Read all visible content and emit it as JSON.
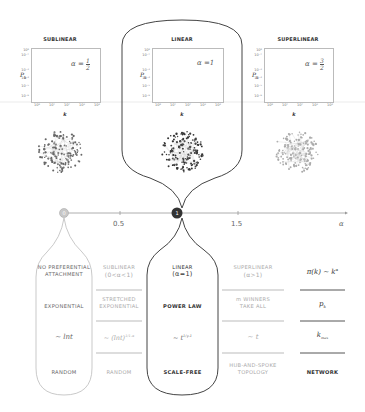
{
  "panels": [
    {
      "id": "sublinear",
      "title": "SUBLINEAR",
      "alpha_label": "α =",
      "alpha_num": "1",
      "alpha_den": "2",
      "ylabel": "P",
      "ylabel_sub": "k",
      "xlabel": "k",
      "style": "light"
    },
    {
      "id": "linear",
      "title": "LINEAR",
      "alpha_label": "α =1",
      "ylabel": "P",
      "ylabel_sub": "k",
      "xlabel": "k",
      "style": "highlight"
    },
    {
      "id": "superlinear",
      "title": "SUPERLINEAR",
      "alpha_label": "α =",
      "alpha_num": "3",
      "alpha_den": "2",
      "ylabel": "P",
      "ylabel_sub": "k",
      "xlabel": "k",
      "style": "light"
    }
  ],
  "plot_axes": {
    "yticks": [
      "10⁰",
      "10⁻¹",
      "10⁻³",
      "10⁻⁴",
      "10⁻⁵",
      "10⁻⁶"
    ],
    "xticks": [
      "10⁰",
      "10¹",
      "10²",
      "10³",
      "10⁴"
    ]
  },
  "axis": {
    "ticks": [
      {
        "label": "0",
        "marker": "circle-light"
      },
      {
        "label": "0.5",
        "marker": "tick"
      },
      {
        "label": "1",
        "marker": "circle-dark"
      },
      {
        "label": "1.5",
        "marker": "tick"
      }
    ],
    "variable": "α"
  },
  "table": {
    "columns": [
      {
        "id": "no_pa",
        "cells": [
          "NO PREFERENTIAL\nATTACHMENT",
          "EXPONENTIAL",
          "~ lnt",
          "RANDOM"
        ]
      },
      {
        "id": "sublinear",
        "cells": [
          "SUBLINEAR\n(0<α<1)",
          "STRETCHED\nEXPONENTIAL",
          "~ (lnt)^(1/(1-α))",
          "RANDOM"
        ]
      },
      {
        "id": "linear",
        "cells": [
          "LINEAR\n(α=1)",
          "POWER LAW",
          "~ t^(1/(γ-1))",
          "SCALE-FREE"
        ]
      },
      {
        "id": "superlinear",
        "cells": [
          "SUPERLINEAR\n(α>1)",
          "m WINNERS\nTAKE ALL",
          "~ t",
          "HUB-AND-SPOKE\nTOPOLOGY"
        ]
      },
      {
        "id": "legend",
        "cells": [
          "π(k) ~ k^α",
          "p_k",
          "k_max",
          "NETWORK"
        ]
      }
    ],
    "labels": {
      "no_pa_r1a": "NO PREFERENTIAL",
      "no_pa_r1b": "ATTACHMENT",
      "no_pa_r2": "EXPONENTIAL",
      "no_pa_r3": "~ lnt",
      "no_pa_r4": "RANDOM",
      "sub_r1a": "SUBLINEAR",
      "sub_r1b": "(0<α<1)",
      "sub_r2a": "STRETCHED",
      "sub_r2b": "EXPONENTIAL",
      "sub_r3": "~ (lnt)",
      "sub_r3_exp_num": "1",
      "sub_r3_exp_den": "1-α",
      "sub_r4": "RANDOM",
      "lin_r1a": "LINEAR",
      "lin_r1b": "(α=1)",
      "lin_r2": "POWER LAW",
      "lin_r3": "~ t",
      "lin_r3_exp_num": "1",
      "lin_r3_exp_den": "γ-1",
      "lin_r4": "SCALE-FREE",
      "sup_r1a": "SUPERLINEAR",
      "sup_r1b": "(α>1)",
      "sup_r2a": "m WINNERS",
      "sup_r2b": "TAKE ALL",
      "sup_r3": "~ t",
      "sup_r4a": "HUB-AND-SPOKE",
      "sup_r4b": "TOPOLOGY",
      "leg_r1": "π(k) ~ k",
      "leg_r1_exp": "α",
      "leg_r2": "p",
      "leg_r2_sub": "k",
      "leg_r3": "k",
      "leg_r3_sub": "max",
      "leg_r4": "NETWORK"
    }
  },
  "colors": {
    "dark": "#333333",
    "mid": "#666666",
    "light": "#aaaaaa",
    "line": "#bbbbbb"
  }
}
